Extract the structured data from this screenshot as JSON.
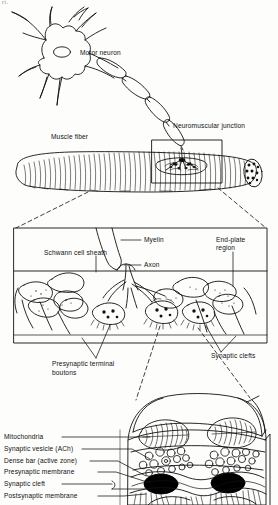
{
  "figure": {
    "corner_mark": "rt.",
    "ink_color": "#111111",
    "paper_color": "#fdfdfc",
    "dense_bar_color": "#000000"
  },
  "panel_top": {
    "name": "motor neuron and muscle fiber overview",
    "labels": {
      "motor_neuron": "Motor neuron",
      "muscle_fiber": "Muscle fiber",
      "neuromuscular_junction": "Neuromuscular junction"
    }
  },
  "panel_middle": {
    "name": "end-plate region magnification",
    "labels": {
      "schwann_cell_sheath": "Schwann cell sheath",
      "myelin": "Myelin",
      "axon": "Axon",
      "end_plate_region_line1": "End-plate",
      "end_plate_region_line2": "region",
      "presynaptic_terminal_boutons_line1": "Presynaptic terminal",
      "presynaptic_terminal_boutons_line2": "boutons",
      "synaptic_clefts": "Synaptic clefts"
    }
  },
  "panel_bottom": {
    "name": "synaptic ultrastructure magnification",
    "labels": [
      "Mitochondria",
      "Synaptic vesicle (ACh)",
      "Dense bar (active zone)",
      "Presynaptic membrane",
      "Synaptic cleft",
      "Postsynaptic membrane"
    ]
  }
}
